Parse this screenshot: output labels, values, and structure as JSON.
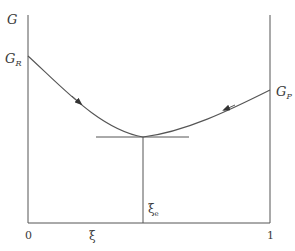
{
  "diagram": {
    "y_axis_label": "G",
    "left_value_label": {
      "main": "G",
      "sub": "R"
    },
    "right_value_label": {
      "main": "G",
      "sub": "P"
    },
    "x_origin_label": "0",
    "x_end_label": "1",
    "x_axis_label": "ξ",
    "equilibrium_label": {
      "main": "ξ",
      "sub": "e"
    },
    "colors": {
      "line": "#555555",
      "text": "#3a3a3a",
      "background": "#ffffff"
    }
  }
}
